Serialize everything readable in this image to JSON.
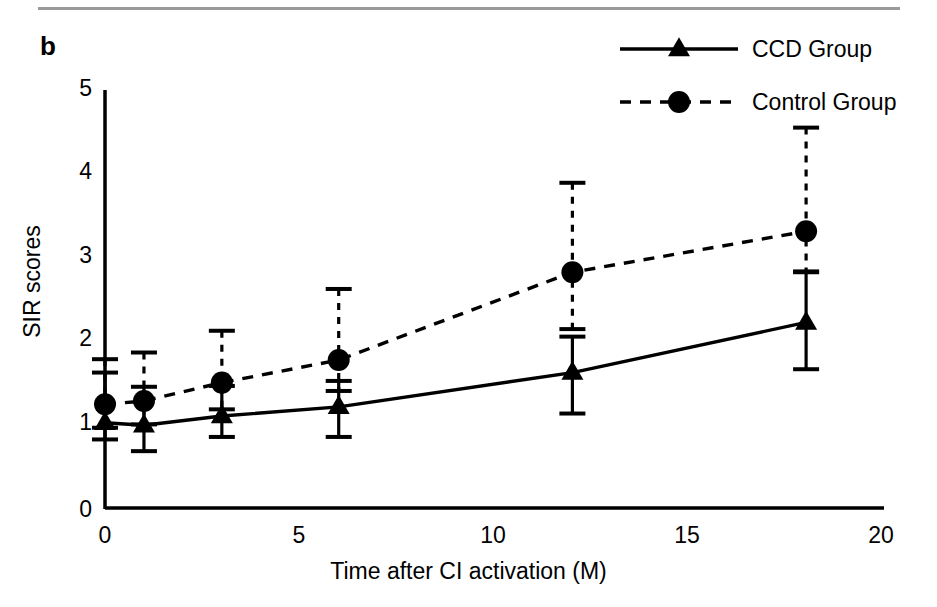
{
  "figure": {
    "panel_label": "b"
  },
  "chart_data": {
    "type": "line",
    "title": "",
    "xlabel": "Time after CI activation (M)",
    "ylabel": "SIR scores",
    "xlim": [
      0,
      20
    ],
    "ylim": [
      0,
      5
    ],
    "xticks": [
      0,
      5,
      10,
      15,
      20
    ],
    "xtick_labels": [
      "0",
      "5",
      "10",
      "15",
      "20"
    ],
    "yticks": [
      0,
      1,
      2,
      3,
      4,
      5
    ],
    "ytick_labels": [
      "0",
      "1",
      "2",
      "3",
      "4",
      "5"
    ],
    "grid": false,
    "legend_position": "top-right",
    "x": [
      0,
      1,
      3,
      6,
      12,
      18
    ],
    "series": [
      {
        "name": "CCD Group",
        "style": "solid",
        "marker": "triangle",
        "color": "#000000",
        "values": [
          1.02,
          0.99,
          1.1,
          1.21,
          1.62,
          2.22
        ],
        "err_upper": [
          1.62,
          1.45,
          1.46,
          1.52,
          2.05,
          2.82
        ],
        "err_lower": [
          0.82,
          0.68,
          0.85,
          0.85,
          1.13,
          1.66
        ]
      },
      {
        "name": "Control Group",
        "style": "dashed",
        "marker": "circle",
        "color": "#000000",
        "values": [
          1.24,
          1.28,
          1.5,
          1.77,
          2.82,
          3.31
        ],
        "err_upper": [
          1.78,
          1.86,
          2.12,
          2.62,
          3.89,
          4.55
        ],
        "err_lower": [
          0.96,
          1.0,
          1.18,
          1.4,
          2.14,
          2.83
        ]
      }
    ]
  },
  "legend": {
    "items": [
      {
        "label": "CCD Group"
      },
      {
        "label": "Control Group"
      }
    ]
  }
}
